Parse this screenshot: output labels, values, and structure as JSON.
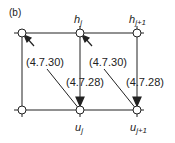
{
  "diagram": {
    "panel_label": "(b)",
    "top_nodes": [
      {
        "id": "h_jm1",
        "label": "",
        "sub": ""
      },
      {
        "id": "h_j",
        "label": "h",
        "sub": "j"
      },
      {
        "id": "h_jp1",
        "label": "h",
        "sub": "j+1"
      }
    ],
    "bottom_nodes": [
      {
        "id": "u_jm1",
        "label": "",
        "sub": ""
      },
      {
        "id": "u_j",
        "label": "u",
        "sub": "j"
      },
      {
        "id": "u_jp1",
        "label": "u",
        "sub": "j+1"
      }
    ],
    "equation_labels": [
      {
        "text": "(4.7.30)",
        "position": "left"
      },
      {
        "text": "(4.7.30)",
        "position": "right"
      },
      {
        "text": "(4.7.28)",
        "position": "left"
      },
      {
        "text": "(4.7.28)",
        "position": "right"
      }
    ],
    "colors": {
      "line": "#222222",
      "node_fill": "#ffffff"
    }
  }
}
